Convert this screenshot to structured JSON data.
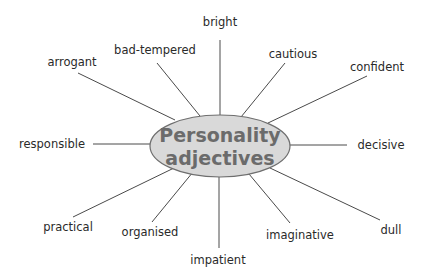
{
  "diagram": {
    "type": "mind-map",
    "center": {
      "line1": "Personality",
      "line2": "adjectives",
      "fill_color": "#d9d9d9",
      "text_color": "#6b6b6b"
    },
    "nodes": [
      {
        "id": "bright",
        "label": "bright"
      },
      {
        "id": "cautious",
        "label": "cautious"
      },
      {
        "id": "confident",
        "label": "confident"
      },
      {
        "id": "decisive",
        "label": "decisive"
      },
      {
        "id": "dull",
        "label": "dull"
      },
      {
        "id": "imaginative",
        "label": "imaginative"
      },
      {
        "id": "impatient",
        "label": "impatient"
      },
      {
        "id": "organised",
        "label": "organised"
      },
      {
        "id": "practical",
        "label": "practical"
      },
      {
        "id": "responsible",
        "label": "responsible"
      },
      {
        "id": "arrogant",
        "label": "arrogant"
      },
      {
        "id": "bad-tempered",
        "label": "bad-tempered"
      }
    ],
    "edge_color": "#4a4a4a"
  }
}
